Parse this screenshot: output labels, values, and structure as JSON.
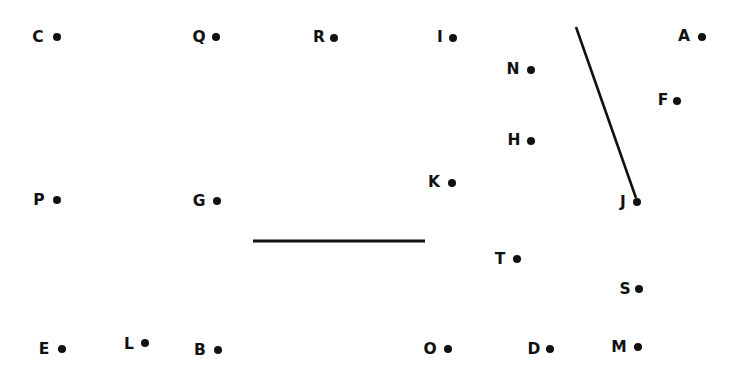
{
  "canvas": {
    "width": 742,
    "height": 373,
    "background_color": "#ffffff",
    "ink_color": "#111111"
  },
  "diagram": {
    "dot_radius_px": 4,
    "label_font_size_px": 15.5
  },
  "points": [
    {
      "id": "C",
      "label": "C",
      "label_x": 38,
      "label_y": 38,
      "dot_x": 57,
      "dot_y": 37
    },
    {
      "id": "Q",
      "label": "Q",
      "label_x": 199,
      "label_y": 38,
      "dot_x": 216,
      "dot_y": 37
    },
    {
      "id": "R",
      "label": "R",
      "label_x": 319,
      "label_y": 38,
      "dot_x": 334,
      "dot_y": 38
    },
    {
      "id": "I",
      "label": "I",
      "label_x": 440,
      "label_y": 38,
      "dot_x": 453,
      "dot_y": 38
    },
    {
      "id": "A",
      "label": "A",
      "label_x": 684,
      "label_y": 37,
      "dot_x": 702,
      "dot_y": 37
    },
    {
      "id": "N",
      "label": "N",
      "label_x": 513,
      "label_y": 70,
      "dot_x": 531,
      "dot_y": 70
    },
    {
      "id": "F",
      "label": "F",
      "label_x": 663,
      "label_y": 101,
      "dot_x": 677,
      "dot_y": 101
    },
    {
      "id": "H",
      "label": "H",
      "label_x": 514,
      "label_y": 141,
      "dot_x": 531,
      "dot_y": 141
    },
    {
      "id": "K",
      "label": "K",
      "label_x": 434,
      "label_y": 183,
      "dot_x": 452,
      "dot_y": 183
    },
    {
      "id": "P",
      "label": "P",
      "label_x": 39,
      "label_y": 201,
      "dot_x": 57,
      "dot_y": 200
    },
    {
      "id": "G",
      "label": "G",
      "label_x": 199,
      "label_y": 202,
      "dot_x": 217,
      "dot_y": 201
    },
    {
      "id": "J",
      "label": "J",
      "label_x": 623,
      "label_y": 203,
      "dot_x": 637,
      "dot_y": 202
    },
    {
      "id": "T",
      "label": "T",
      "label_x": 500,
      "label_y": 260,
      "dot_x": 517,
      "dot_y": 259
    },
    {
      "id": "S",
      "label": "S",
      "label_x": 625,
      "label_y": 290,
      "dot_x": 639,
      "dot_y": 289
    },
    {
      "id": "E",
      "label": "E",
      "label_x": 44,
      "label_y": 350,
      "dot_x": 62,
      "dot_y": 349
    },
    {
      "id": "L",
      "label": "L",
      "label_x": 129,
      "label_y": 345,
      "dot_x": 145,
      "dot_y": 343
    },
    {
      "id": "B",
      "label": "B",
      "label_x": 200,
      "label_y": 351,
      "dot_x": 218,
      "dot_y": 350
    },
    {
      "id": "O",
      "label": "O",
      "label_x": 430,
      "label_y": 350,
      "dot_x": 448,
      "dot_y": 349
    },
    {
      "id": "D",
      "label": "D",
      "label_x": 534,
      "label_y": 350,
      "dot_x": 550,
      "dot_y": 349
    },
    {
      "id": "M",
      "label": "M",
      "label_x": 619,
      "label_y": 348,
      "dot_x": 638,
      "dot_y": 347
    }
  ],
  "segments": [
    {
      "id": "segment-diagonal",
      "name": "diagonal-segment-near-J",
      "x1": 576,
      "y1": 27,
      "x2": 636,
      "y2": 198,
      "stroke_width": 2.6
    },
    {
      "id": "segment-horizontal",
      "name": "horizontal-segment-center",
      "x1": 253,
      "y1": 241,
      "x2": 425,
      "y2": 241,
      "stroke_width": 2.8
    }
  ]
}
